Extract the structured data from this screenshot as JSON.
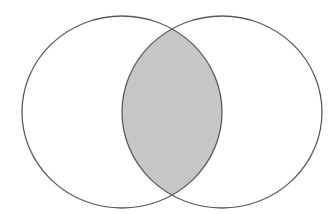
{
  "diagram": {
    "type": "venn",
    "canvas": {
      "width": 335,
      "height": 214,
      "background": "#ffffff"
    },
    "sets": [
      {
        "id": "A",
        "cx": 122,
        "cy": 112,
        "rx": 100,
        "ry": 96
      },
      {
        "id": "B",
        "cx": 222,
        "cy": 112,
        "rx": 100,
        "ry": 96
      }
    ],
    "highlighted_region": "intersection",
    "colors": {
      "stroke": "#5a5a5a",
      "intersection_fill": "#c6c6c6",
      "set_fill": "#ffffff"
    },
    "stroke_width": 1.3
  }
}
